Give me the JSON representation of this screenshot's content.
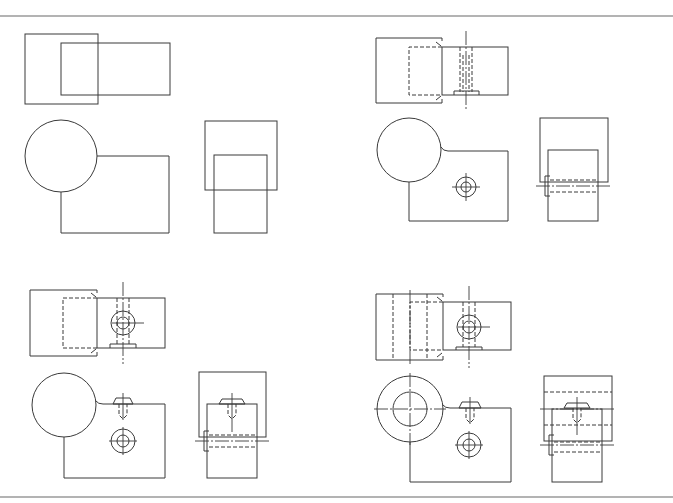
{
  "drawing": {
    "type": "orthographic-views",
    "stroke_color": "#3a3a3a",
    "rule_color": "#9a9a9a",
    "panels": [
      {
        "id": 1,
        "label": "basic-blocks",
        "views": [
          "top",
          "front",
          "side"
        ]
      },
      {
        "id": 2,
        "label": "with-slot-and-hole",
        "views": [
          "top",
          "front",
          "side"
        ]
      },
      {
        "id": 3,
        "label": "with-counterbored-hole",
        "views": [
          "top",
          "front",
          "side"
        ]
      },
      {
        "id": 4,
        "label": "with-bored-cylinder",
        "views": [
          "top",
          "front",
          "side"
        ]
      }
    ]
  }
}
